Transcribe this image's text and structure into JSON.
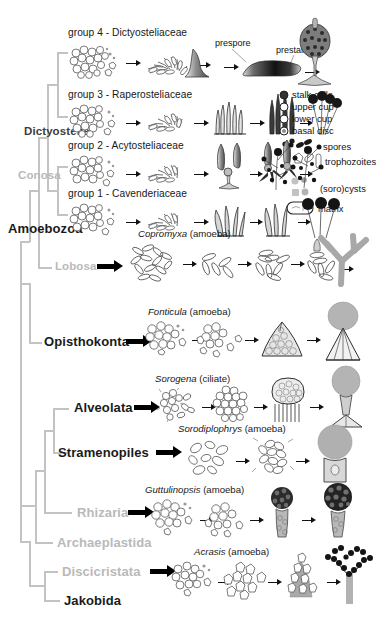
{
  "figure": {
    "background_color": "#ffffff",
    "tree_line_color": "#c3c3c3",
    "text_color": "#1a1a1a",
    "muted_text_color": "#b9b9b9"
  },
  "tree": {
    "taxa": [
      {
        "label": "Dictyostelia",
        "style": "dark",
        "x": 24,
        "y": 131,
        "has_arrow": false
      },
      {
        "label": "Conosa",
        "style": "gray",
        "x": 18,
        "y": 175,
        "has_arrow": false
      },
      {
        "label": "Amoebozoa",
        "style": "black",
        "x": 8,
        "y": 228,
        "has_arrow": false,
        "big": true
      },
      {
        "label": "Lobosa",
        "style": "gray",
        "x": 55,
        "y": 262,
        "has_arrow": true
      },
      {
        "label": "Opisthokonta",
        "style": "black",
        "x": 44,
        "y": 337,
        "has_arrow": true
      },
      {
        "label": "Alveolata",
        "style": "black",
        "x": 74,
        "y": 403,
        "has_arrow": true
      },
      {
        "label": "Stramenopiles",
        "style": "black",
        "x": 58,
        "y": 448,
        "has_arrow": true
      },
      {
        "label": "Rhizaria",
        "style": "gray",
        "x": 77,
        "y": 508,
        "has_arrow": true
      },
      {
        "label": "Archaeplastida",
        "style": "gray",
        "x": 57,
        "y": 538,
        "has_arrow": false
      },
      {
        "label": "Discicristata",
        "style": "gray",
        "x": 62,
        "y": 567,
        "has_arrow": true
      },
      {
        "label": "Jakobida",
        "style": "black",
        "x": 64,
        "y": 597,
        "has_arrow": false
      }
    ]
  },
  "rows": [
    {
      "id": "group4",
      "label": "group 4 - Dictyosteliaceae",
      "label_x": 68,
      "label_y": 33,
      "stages": [
        "amoebae aggregate",
        "aggregation stream",
        "mound / tipped aggregate",
        "migrating slug",
        "fruiting body (sorocarp)"
      ],
      "annotations": [
        {
          "text": "prespore",
          "x": 215,
          "y": 43
        },
        {
          "text": "prestalk",
          "x": 277,
          "y": 50
        }
      ]
    },
    {
      "id": "group3",
      "label": "group 3 - Raperosteliaceae",
      "label_x": 68,
      "label_y": 95,
      "stages": [
        "amoebae aggregate",
        "aggregation stream",
        "early sorogen",
        "sorogen",
        "fruiting bodies"
      ]
    },
    {
      "id": "group2",
      "label": "group 2 - Acytosteliaceae",
      "label_x": 68,
      "label_y": 146,
      "stages": [
        "amoebae aggregate",
        "aggregation stream",
        "sorogen",
        "branching sorogen",
        "branched fruiting body"
      ]
    },
    {
      "id": "group1",
      "label": "group 1 - Cavenderiaceae",
      "label_x": 68,
      "label_y": 194,
      "stages": [
        "amoebae aggregate",
        "aggregation stream",
        "sorogen",
        "sorogen",
        "fruiting bodies"
      ]
    },
    {
      "id": "copromyxa",
      "label": "Copromyxa (amoeba)",
      "genus": "Copromyxa",
      "suffix": " (amoeba)",
      "label_x": 138,
      "label_y": 234,
      "stages": [
        "amoebae",
        "cells",
        "aggregate",
        "developing sorocarp",
        "branched sorocarp"
      ]
    },
    {
      "id": "fonticula",
      "label": "Fonticula (amoeba)",
      "genus": "Fonticula",
      "suffix": " (amoeba)",
      "label_x": 148,
      "label_y": 311,
      "stages": [
        "amoebae aggregate",
        "cell cluster",
        "volcano-shaped mound",
        "fruiting body"
      ]
    },
    {
      "id": "sorogena",
      "label": "Sorogena (ciliate)",
      "genus": "Sorogena",
      "suffix": " (ciliate)",
      "label_x": 155,
      "label_y": 378,
      "stages": [
        "ciliates",
        "aggregate",
        "developing sorocarp",
        "mature sorocarp"
      ]
    },
    {
      "id": "sorodiplophrys",
      "label": "Sorodiplophrys (amoeba)",
      "genus": "Sorodiplophrys",
      "suffix": " (amoeba)",
      "label_x": 178,
      "label_y": 428,
      "stages": [
        "amoebae",
        "aggregate",
        "sorocarp"
      ]
    },
    {
      "id": "guttulinopsis",
      "label": "Guttulinopsis (amoeba)",
      "genus": "Guttulinopsis",
      "suffix": " (amoeba)",
      "label_x": 145,
      "label_y": 489,
      "stages": [
        "amoebae aggregate",
        "cell cluster",
        "young sorocarp",
        "mature sorocarp"
      ]
    },
    {
      "id": "acrasis",
      "label": "Acrasis (amoeba)",
      "genus": "Acrasis",
      "suffix": " (amoeba)",
      "label_x": 194,
      "label_y": 551,
      "stages": [
        "amoebae aggregate",
        "cells",
        "developing sorocarp",
        "branched sorocarp"
      ]
    }
  ],
  "legend": {
    "cell_types": [
      {
        "label": "stalk cells",
        "marker": "filled-dark-circle",
        "color": "#333333"
      },
      {
        "label": "upper cup",
        "marker": "open-circle",
        "color": "#ffffff"
      },
      {
        "label": "lower cup",
        "marker": "open-circle",
        "color": "#ffffff"
      },
      {
        "label": "basal disc",
        "marker": "gray-ringed-circle",
        "color": "#9a9a9a"
      }
    ],
    "items": [
      {
        "label": "spores",
        "marker": "spores"
      },
      {
        "label": "trophozoites",
        "marker": "trophozoites"
      },
      {
        "label": "(soro)cysts",
        "marker": "sorocysts"
      },
      {
        "label": "matrix",
        "marker": "matrix"
      }
    ]
  }
}
